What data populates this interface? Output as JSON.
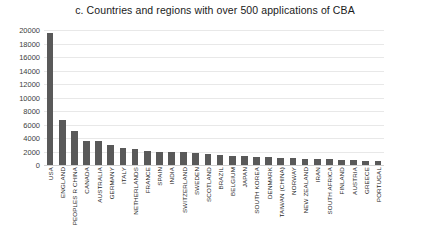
{
  "chart_data": {
    "type": "bar",
    "title": "c. Countries and regions with over 500 applications of CBA",
    "xlabel": "",
    "ylabel": "",
    "ylim": [
      0,
      20000
    ],
    "y_ticks": [
      20000,
      18000,
      16000,
      14000,
      12000,
      10000,
      8000,
      6000,
      4000,
      2000,
      0
    ],
    "grid": true,
    "legend": "none",
    "bar_color": "#595959",
    "gridline_color": "#e8e8e8",
    "categories": [
      "USA",
      "ENGLAND",
      "PEOPLES R CHINA",
      "CANADA",
      "AUSTRALIA",
      "GERMANY",
      "ITALY",
      "NETHERLANDS",
      "FRANCE",
      "SPAIN",
      "INDIA",
      "SWITZERLAND",
      "SWEDEN",
      "SCOTLAND",
      "BRAZIL",
      "BELGIUM",
      "JAPAN",
      "SOUTH KOREA",
      "DENMARK",
      "TAIWAN (CHINA)",
      "NORWAY",
      "NEW ZEALAND",
      "IRAN",
      "SOUTH AFRICA",
      "FINLAND",
      "AUSTRIA",
      "GREECE",
      "PORTUGAL"
    ],
    "values": [
      19600,
      6700,
      5000,
      3600,
      3500,
      2900,
      2500,
      2300,
      2100,
      2000,
      1950,
      1900,
      1750,
      1650,
      1500,
      1400,
      1300,
      1250,
      1150,
      1050,
      1000,
      950,
      900,
      850,
      800,
      720,
      650,
      560
    ]
  }
}
